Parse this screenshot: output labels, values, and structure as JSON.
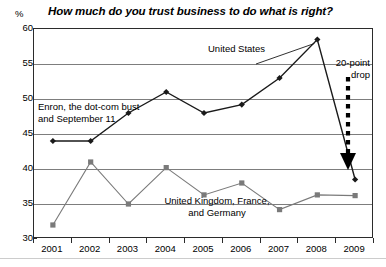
{
  "chart_data": {
    "type": "line",
    "title": "How much do you trust business to do what is right?",
    "xlabel": "",
    "ylabel": "%",
    "ylim": [
      30,
      60
    ],
    "ytick_step": 5,
    "yticks": [
      30,
      35,
      40,
      45,
      50,
      55,
      60
    ],
    "grid": true,
    "legend_position": "inline-annotations",
    "categories": [
      "2001",
      "2002",
      "2003",
      "2004",
      "2005",
      "2006",
      "2007",
      "2008",
      "2009"
    ],
    "series": [
      {
        "name": "United States",
        "color": "#1a1a1a",
        "marker": "diamond",
        "values": [
          44,
          44,
          48,
          51,
          48,
          49.2,
          53,
          58.5,
          38.5
        ]
      },
      {
        "name": "United Kingdom, France, and Germany",
        "color": "#7a7a7a",
        "marker": "square",
        "values": [
          32,
          41,
          35,
          40.2,
          36.3,
          38,
          34.2,
          36.3,
          36.2
        ]
      }
    ],
    "annotations": [
      {
        "id": "enron",
        "text": "Enron, the dot-com bust\nand September 11"
      },
      {
        "id": "united-states",
        "text": "United States"
      },
      {
        "id": "uk-france-germany",
        "text": "United Kingdom, France,\nand Germany"
      },
      {
        "id": "drop",
        "text": "20-point\ndrop"
      }
    ]
  },
  "axis": {
    "unit_label": "%"
  },
  "footer": {
    "source": ""
  }
}
